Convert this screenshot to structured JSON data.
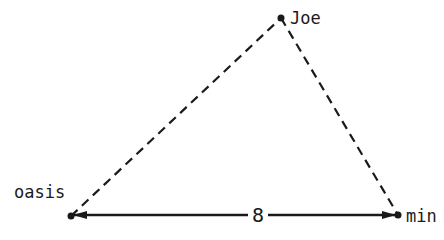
{
  "diagram": {
    "type": "triangle",
    "nodes": [
      {
        "id": "oasis",
        "label": "oasis",
        "x": 71,
        "y": 216
      },
      {
        "id": "joe",
        "label": "Joe",
        "x": 281,
        "y": 18
      },
      {
        "id": "mine",
        "label": "min",
        "x": 398,
        "y": 215
      }
    ],
    "edges": [
      {
        "from": "oasis",
        "to": "joe",
        "style": "dashed",
        "label": ""
      },
      {
        "from": "joe",
        "to": "mine",
        "style": "dashed",
        "label": ""
      },
      {
        "from": "oasis",
        "to": "mine",
        "style": "solid-double-arrow",
        "label": "8"
      }
    ],
    "colors": {
      "line": "#1a1a1a",
      "background": "#ffffff"
    }
  }
}
